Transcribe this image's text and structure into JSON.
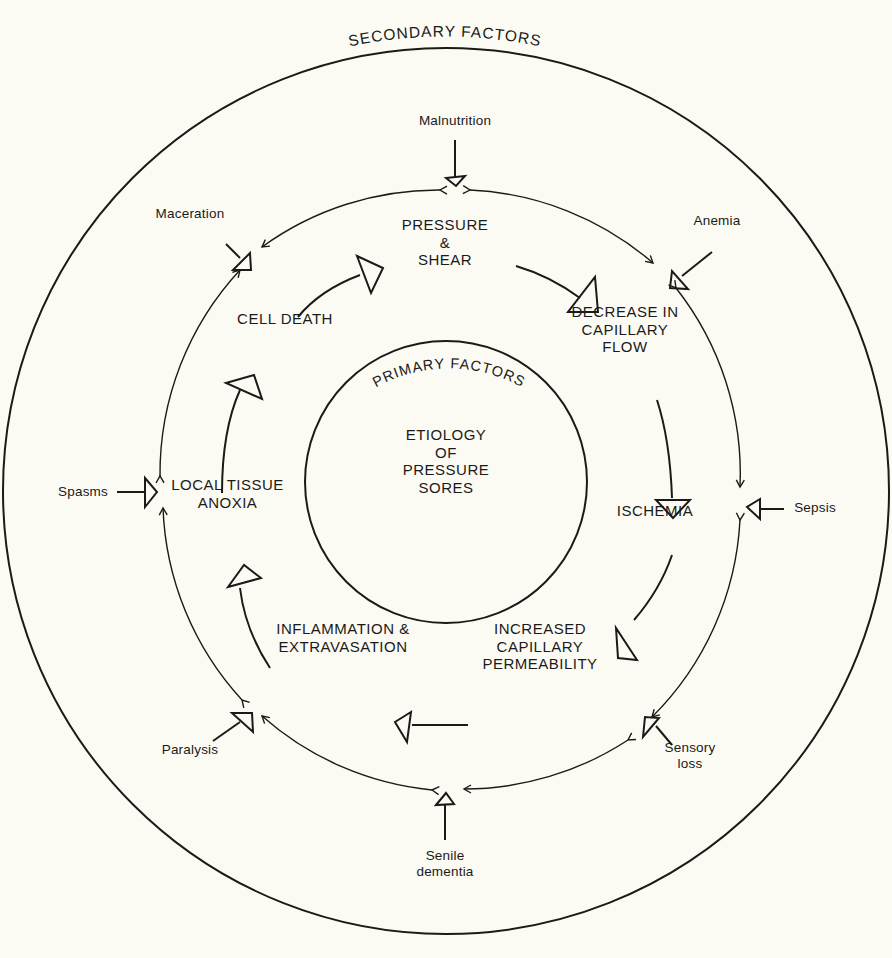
{
  "diagram": {
    "title_outer": "SECONDARY FACTORS",
    "title_inner": "PRIMARY FACTORS",
    "center_label": "ETIOLOGY\nOF\nPRESSURE\nSORES",
    "colors": {
      "background": "#fcfbf3",
      "ink": "#1a1a1a"
    },
    "primary_cycle": [
      {
        "id": "pressure-shear",
        "label": "PRESSURE\n&\nSHEAR"
      },
      {
        "id": "decrease-capillary-flow",
        "label": "DECREASE IN\nCAPILLARY\nFLOW"
      },
      {
        "id": "ischemia",
        "label": "ISCHEMIA"
      },
      {
        "id": "increased-capillary-permeability",
        "label": "INCREASED\nCAPILLARY\nPERMEABILITY"
      },
      {
        "id": "inflammation-extravasation",
        "label": "INFLAMMATION &\nEXTRAVASATION"
      },
      {
        "id": "local-tissue-anoxia",
        "label": "LOCAL TISSUE\nANOXIA"
      },
      {
        "id": "cell-death",
        "label": "CELL DEATH"
      }
    ],
    "secondary_factors": [
      {
        "id": "malnutrition",
        "label": "Malnutrition"
      },
      {
        "id": "anemia",
        "label": "Anemia"
      },
      {
        "id": "sepsis",
        "label": "Sepsis"
      },
      {
        "id": "sensory-loss",
        "label": "Sensory\nloss"
      },
      {
        "id": "senile-dementia",
        "label": "Senile\ndementia"
      },
      {
        "id": "paralysis",
        "label": "Paralysis"
      },
      {
        "id": "spasms",
        "label": "Spasms"
      },
      {
        "id": "maceration",
        "label": "Maceration"
      }
    ]
  }
}
